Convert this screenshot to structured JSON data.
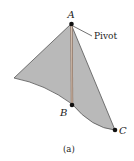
{
  "figure": {
    "caption": "(a)",
    "points": {
      "A": "A",
      "B": "B",
      "C": "C"
    },
    "annotation": "Pivot",
    "colors": {
      "plate_fill": "#b9b9b9",
      "plate_edge": "#555555",
      "rod": "#b89c88",
      "point": "#111111",
      "background": "#ffffff"
    }
  }
}
